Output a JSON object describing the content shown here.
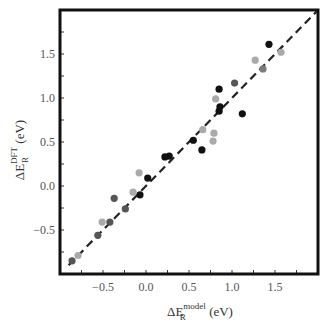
{
  "chart_data": {
    "type": "scatter",
    "title": "",
    "xlabel": "ΔE_R^model (eV)",
    "ylabel": "ΔE_R^DFT (eV)",
    "xlabel_parts": {
      "main": "ΔE",
      "sub": "R",
      "sup": "model",
      "unit": "(eV)"
    },
    "ylabel_parts": {
      "main": "ΔE",
      "sub": "R",
      "sup": "DFT",
      "unit": "(eV)"
    },
    "xlim": [
      -1.0,
      2.0
    ],
    "ylim": [
      -1.0,
      2.0
    ],
    "xticks": [
      -0.5,
      0.0,
      0.5,
      1.0,
      1.5
    ],
    "xtick_labels": [
      "−0.5",
      "0.0",
      "0.5",
      "1.0",
      "1.5"
    ],
    "yticks": [
      -0.5,
      0.0,
      0.5,
      1.0,
      1.5
    ],
    "ytick_labels": [
      "−0.5",
      "0.0",
      "0.5",
      "1.0",
      "1.5"
    ],
    "minor_tick_step": 0.25,
    "grid": false,
    "legend": null,
    "reference_line": {
      "style": "dashed",
      "from": [
        -0.9,
        -0.9
      ],
      "to": [
        2.0,
        2.0
      ],
      "label": "y = x",
      "color": "#222222"
    },
    "colors": {
      "black": "#111111",
      "dark_gray": "#555555",
      "medium_gray": "#7a7a7a",
      "light_gray": "#aaaaaa"
    },
    "series": [
      {
        "name": "black",
        "color": "#111111",
        "points": [
          [
            -0.07,
            -0.1
          ],
          [
            0.02,
            0.09
          ],
          [
            0.22,
            0.33
          ],
          [
            0.27,
            0.34
          ],
          [
            0.55,
            0.52
          ],
          [
            0.65,
            0.41
          ],
          [
            0.85,
            1.1
          ],
          [
            0.85,
            0.85
          ],
          [
            0.86,
            0.9
          ],
          [
            1.12,
            0.82
          ],
          [
            1.43,
            1.61
          ]
        ]
      },
      {
        "name": "dark_gray",
        "color": "#555555",
        "points": [
          [
            -0.86,
            -0.85
          ],
          [
            -0.56,
            -0.56
          ],
          [
            -0.42,
            -0.41
          ],
          [
            -0.37,
            -0.14
          ],
          [
            -0.24,
            -0.26
          ],
          [
            1.03,
            1.17
          ]
        ]
      },
      {
        "name": "medium_gray",
        "color": "#7a7a7a",
        "points": [
          [
            1.36,
            1.33
          ]
        ]
      },
      {
        "name": "light_gray",
        "color": "#aaaaaa",
        "points": [
          [
            -0.79,
            -0.79
          ],
          [
            -0.51,
            -0.41
          ],
          [
            -0.15,
            -0.07
          ],
          [
            -0.08,
            0.15
          ],
          [
            0.66,
            0.64
          ],
          [
            0.78,
            0.51
          ],
          [
            0.79,
            0.6
          ],
          [
            0.81,
            0.99
          ],
          [
            1.27,
            1.43
          ],
          [
            1.57,
            1.52
          ]
        ]
      }
    ]
  }
}
